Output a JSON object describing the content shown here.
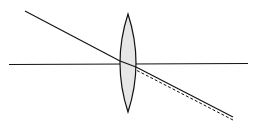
{
  "diagram": {
    "type": "thin-lens-ray-refraction",
    "colors": {
      "background": "#ffffff",
      "stroke": "#111111",
      "lens_fill": "#e6e6e6"
    },
    "elements": [
      {
        "name": "optical-axis",
        "style": "solid"
      },
      {
        "name": "convex-lens",
        "style": "filled"
      },
      {
        "name": "incident-ray",
        "style": "solid"
      },
      {
        "name": "refracted-ray",
        "style": "solid"
      },
      {
        "name": "undeviated-ray-extension",
        "style": "dashed"
      }
    ]
  }
}
